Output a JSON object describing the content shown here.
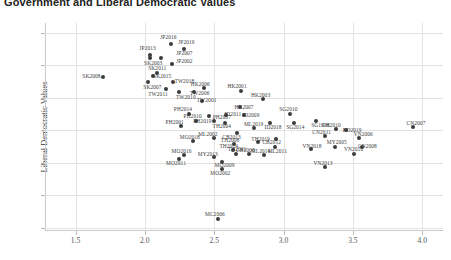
{
  "chart_data": {
    "type": "scatter",
    "title": "Government and Liberal Democratic Values",
    "xlabel": "",
    "ylabel": "Liberal Democratic Values",
    "xlim": [
      1.28,
      4.15
    ],
    "ylim": [
      1.78,
      3.06
    ],
    "xticks": [
      "1.5",
      "2.0",
      "2.5",
      "3.0",
      "3.5",
      "4.0"
    ],
    "xtick_values": [
      1.5,
      2.0,
      2.5,
      3.0,
      3.5,
      4.0
    ],
    "yticks": [
      "3.00",
      "2.80",
      "2.60",
      "2.40",
      "2.20",
      "2.00",
      "1.80"
    ],
    "ytick_values": [
      3.0,
      2.8,
      2.6,
      2.4,
      2.2,
      2.0,
      1.8
    ],
    "grid": true,
    "legend": "none",
    "marker_color": "#3b3b3b",
    "points": [
      {
        "label": "JP2016",
        "x": 2.19,
        "y": 2.93,
        "lx": 2.17,
        "ly": 2.975
      },
      {
        "label": "JP2019",
        "x": 2.28,
        "y": 2.9,
        "lx": 2.3,
        "ly": 2.945
      },
      {
        "label": "JP2013",
        "x": 2.04,
        "y": 2.865,
        "lx": 2.02,
        "ly": 2.905
      },
      {
        "label": "JP2007",
        "x": 2.115,
        "y": 2.845,
        "lx": 2.285,
        "ly": 2.875
      },
      {
        "label": "SK2003",
        "x": 2.04,
        "y": 2.845,
        "lx": 2.06,
        "ly": 2.815
      },
      {
        "label": "JP2002",
        "x": 2.195,
        "y": 2.805,
        "lx": 2.285,
        "ly": 2.825
      },
      {
        "label": "SK2011",
        "x": 2.09,
        "y": 2.755,
        "lx": 2.09,
        "ly": 2.785
      },
      {
        "label": "SK2015",
        "x": 2.06,
        "y": 2.735,
        "lx": 2.125,
        "ly": 2.735
      },
      {
        "label": "SK2008",
        "x": 1.7,
        "y": 2.73,
        "lx": 1.615,
        "ly": 2.735
      },
      {
        "label": "SK2007",
        "x": 2.02,
        "y": 2.695,
        "lx": 2.055,
        "ly": 2.665
      },
      {
        "label": "TW2018",
        "x": 2.205,
        "y": 2.7,
        "lx": 2.285,
        "ly": 2.705
      },
      {
        "label": "TW2011",
        "x": 2.155,
        "y": 2.655,
        "lx": 2.095,
        "ly": 2.625
      },
      {
        "label": "TW2010",
        "x": 2.245,
        "y": 2.635,
        "lx": 2.295,
        "ly": 2.605
      },
      {
        "label": "HK2006",
        "x": 2.425,
        "y": 2.66,
        "lx": 2.4,
        "ly": 2.685
      },
      {
        "label": "TW2006",
        "x": 2.355,
        "y": 2.635,
        "lx": 2.395,
        "ly": 2.63
      },
      {
        "label": "TW2001",
        "x": 2.41,
        "y": 2.58,
        "lx": 2.445,
        "ly": 2.585
      },
      {
        "label": "HK2001",
        "x": 2.695,
        "y": 2.64,
        "lx": 2.665,
        "ly": 2.67
      },
      {
        "label": "HK2003",
        "x": 2.855,
        "y": 2.59,
        "lx": 2.835,
        "ly": 2.62
      },
      {
        "label": "HK2007",
        "x": 2.685,
        "y": 2.545,
        "lx": 2.715,
        "ly": 2.545
      },
      {
        "label": "PH2014",
        "x": 2.315,
        "y": 2.5,
        "lx": 2.275,
        "ly": 2.53
      },
      {
        "label": "PH2019",
        "x": 2.465,
        "y": 2.485,
        "lx": 2.415,
        "ly": 2.455
      },
      {
        "label": "PH2010",
        "x": 2.365,
        "y": 2.455,
        "lx": 2.345,
        "ly": 2.485
      },
      {
        "label": "PH2007",
        "x": 2.495,
        "y": 2.455,
        "lx": 2.555,
        "ly": 2.48
      },
      {
        "label": "PH2001",
        "x": 2.26,
        "y": 2.425,
        "lx": 2.215,
        "ly": 2.45
      },
      {
        "label": "ID2011",
        "x": 2.585,
        "y": 2.495,
        "lx": 2.635,
        "ly": 2.5
      },
      {
        "label": "ID2009",
        "x": 2.715,
        "y": 2.495,
        "lx": 2.765,
        "ly": 2.495
      },
      {
        "label": "TH2004",
        "x": 2.575,
        "y": 2.445,
        "lx": 2.555,
        "ly": 2.425
      },
      {
        "label": "ID2018",
        "x": 2.905,
        "y": 2.445,
        "lx": 2.925,
        "ly": 2.42
      },
      {
        "label": "SG2010",
        "x": 3.045,
        "y": 2.5,
        "lx": 3.035,
        "ly": 2.53
      },
      {
        "label": "SG2014",
        "x": 3.075,
        "y": 2.445,
        "lx": 3.085,
        "ly": 2.42
      },
      {
        "label": "SG1996",
        "x": 3.235,
        "y": 2.46,
        "lx": 3.265,
        "ly": 2.435
      },
      {
        "label": "CH2010",
        "x": 3.375,
        "y": 2.41,
        "lx": 3.345,
        "ly": 2.435
      },
      {
        "label": "CN2011",
        "x": 3.3,
        "y": 2.365,
        "lx": 3.275,
        "ly": 2.39
      },
      {
        "label": "BD2019",
        "x": 3.45,
        "y": 2.4,
        "lx": 3.495,
        "ly": 2.4
      },
      {
        "label": "CN2007",
        "x": 3.935,
        "y": 2.42,
        "lx": 3.955,
        "ly": 2.445
      },
      {
        "label": "VN2006",
        "x": 3.545,
        "y": 2.355,
        "lx": 3.575,
        "ly": 2.38
      },
      {
        "label": "MY2005",
        "x": 3.37,
        "y": 2.3,
        "lx": 3.385,
        "ly": 2.325
      },
      {
        "label": "CN2008",
        "x": 3.565,
        "y": 2.295,
        "lx": 3.605,
        "ly": 2.305
      },
      {
        "label": "VN2010",
        "x": 3.505,
        "y": 2.255,
        "lx": 3.505,
        "ly": 2.285
      },
      {
        "label": "VN2018",
        "x": 3.195,
        "y": 2.285,
        "lx": 3.205,
        "ly": 2.305
      },
      {
        "label": "VN2013",
        "x": 3.3,
        "y": 2.175,
        "lx": 3.285,
        "ly": 2.2
      },
      {
        "label": "ML2019",
        "x": 2.785,
        "y": 2.415,
        "lx": 2.785,
        "ly": 2.44
      },
      {
        "label": "CB2013",
        "x": 2.665,
        "y": 2.385,
        "lx": 2.625,
        "ly": 2.36
      },
      {
        "label": "ML2002",
        "x": 2.495,
        "y": 2.355,
        "lx": 2.455,
        "ly": 2.375
      },
      {
        "label": "CB2012",
        "x": 2.945,
        "y": 2.345,
        "lx": 2.915,
        "ly": 2.325
      },
      {
        "label": "ML2011",
        "x": 2.935,
        "y": 2.295,
        "lx": 2.955,
        "ly": 2.27
      },
      {
        "label": "ML2014",
        "x": 2.86,
        "y": 2.245,
        "lx": 2.835,
        "ly": 2.27
      },
      {
        "label": "TH2019",
        "x": 2.815,
        "y": 2.325,
        "lx": 2.835,
        "ly": 2.345
      },
      {
        "label": "CB2008",
        "x": 2.75,
        "y": 2.255,
        "lx": 2.725,
        "ly": 2.28
      },
      {
        "label": "TH2008",
        "x": 2.64,
        "y": 2.315,
        "lx": 2.615,
        "ly": 2.34
      },
      {
        "label": "TH2014",
        "x": 2.635,
        "y": 2.28,
        "lx": 2.605,
        "ly": 2.305
      },
      {
        "label": "TH2001",
        "x": 2.66,
        "y": 2.255,
        "lx": 2.665,
        "ly": 2.285
      },
      {
        "label": "MY2013",
        "x": 2.5,
        "y": 2.235,
        "lx": 2.455,
        "ly": 2.255
      },
      {
        "label": "MO2018",
        "x": 2.35,
        "y": 2.335,
        "lx": 2.325,
        "ly": 2.36
      },
      {
        "label": "MO2016",
        "x": 2.28,
        "y": 2.245,
        "lx": 2.265,
        "ly": 2.275
      },
      {
        "label": "MO2011",
        "x": 2.245,
        "y": 2.225,
        "lx": 2.225,
        "ly": 2.2
      },
      {
        "label": "MO2009",
        "x": 2.555,
        "y": 2.205,
        "lx": 2.575,
        "ly": 2.185
      },
      {
        "label": "MO2002",
        "x": 2.555,
        "y": 2.16,
        "lx": 2.545,
        "ly": 2.135
      },
      {
        "label": "MC2006",
        "x": 2.525,
        "y": 1.855,
        "lx": 2.505,
        "ly": 1.885
      }
    ]
  }
}
